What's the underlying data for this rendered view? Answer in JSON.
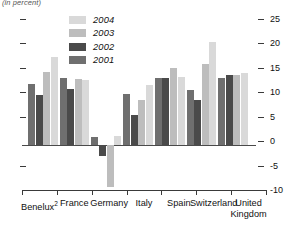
{
  "units_note": "(in percent)",
  "chart_data": {
    "type": "bar",
    "title": "",
    "subtitle": "",
    "units_note": "(in percent)",
    "xlabel": "",
    "ylabel": "",
    "ylim": [
      -10,
      25
    ],
    "yticks": [
      25,
      20,
      15,
      10,
      5,
      0,
      -5,
      -10
    ],
    "ytick_labels": [
      "25",
      "20",
      "15",
      "10",
      "5",
      "0",
      "-5",
      "-10"
    ],
    "grid": false,
    "zero_line": true,
    "axis_side": "right",
    "legend_position": "top-left-inside",
    "categories": [
      "Benelux",
      "France",
      "Germany",
      "Italy",
      "Spain",
      "Switzerland",
      "United Kingdom"
    ],
    "category_labels": [
      "Benelux2",
      "France",
      "Germany",
      "Italy",
      "Spain",
      "Switzerland",
      "United Kingdom"
    ],
    "category_footnotes": {
      "Benelux": "2"
    },
    "series": [
      {
        "name": "2001",
        "color": "#6f6f6f",
        "values": [
          12.5,
          13.8,
          1.7,
          10.4,
          13.8,
          11.3,
          13.8
        ]
      },
      {
        "name": "2002",
        "color": "#4a4a4a",
        "values": [
          10.3,
          11.5,
          -2.2,
          6.2,
          13.8,
          9.3,
          14.3
        ]
      },
      {
        "name": "2003",
        "color": "#bdbdbd",
        "values": [
          15.0,
          13.5,
          -8.5,
          9.3,
          15.8,
          16.5,
          14.4
        ]
      },
      {
        "name": "2004",
        "color": "#d9d9d9",
        "values": [
          18.0,
          13.3,
          1.9,
          12.2,
          13.9,
          21.0,
          14.7
        ]
      }
    ],
    "legend_order": [
      "2004",
      "2003",
      "2002",
      "2001"
    ]
  },
  "legend": {
    "entries": [
      {
        "label": "2004",
        "color": "#d9d9d9"
      },
      {
        "label": "2003",
        "color": "#bdbdbd"
      },
      {
        "label": "2002",
        "color": "#4a4a4a"
      },
      {
        "label": "2001",
        "color": "#6f6f6f"
      }
    ]
  },
  "colors": {
    "axis": "#3a3a3a",
    "zero_line": "#4a4a4a",
    "text": "#111111",
    "background": "#ffffff"
  }
}
